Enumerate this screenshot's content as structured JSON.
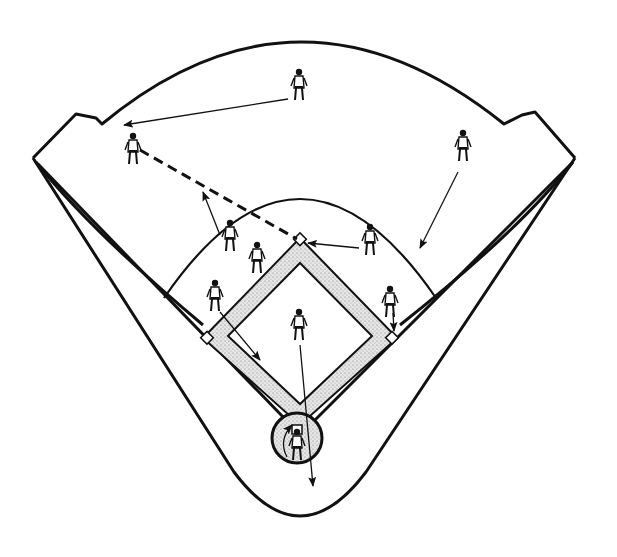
{
  "diagram": {
    "type": "baseball-field-play-diagram",
    "colors": {
      "line": "#111111",
      "background": "#ffffff",
      "dirt": "#d8d8d8"
    },
    "field": {
      "outfield_fence": "curved fence with angled corners",
      "infield_arc": "grass-line arc",
      "bases": [
        "home-plate",
        "first-base",
        "second-base",
        "third-base"
      ],
      "pitchers_mound": false,
      "home_circle": true
    },
    "players": [
      {
        "id": "center-fielder",
        "x": 299,
        "y": 84
      },
      {
        "id": "left-fielder",
        "x": 133,
        "y": 149
      },
      {
        "id": "right-fielder",
        "x": 463,
        "y": 146
      },
      {
        "id": "shortstop",
        "x": 230,
        "y": 236
      },
      {
        "id": "baserunner",
        "x": 257,
        "y": 258
      },
      {
        "id": "second-baseman",
        "x": 370,
        "y": 240
      },
      {
        "id": "third-baseman",
        "x": 215,
        "y": 296
      },
      {
        "id": "first-baseman",
        "x": 390,
        "y": 302
      },
      {
        "id": "pitcher",
        "x": 299,
        "y": 325
      },
      {
        "id": "catcher",
        "x": 297,
        "y": 437
      }
    ],
    "movements": [
      {
        "from": "center-fielder",
        "to_x": 122,
        "to_y": 125,
        "kind": "run"
      },
      {
        "from": "right-fielder",
        "to_x": 418,
        "to_y": 250,
        "kind": "run"
      },
      {
        "from": "shortstop",
        "to_x": 203,
        "to_y": 192,
        "kind": "run"
      },
      {
        "from": "second-baseman",
        "to_x": 306,
        "to_y": 243,
        "kind": "run"
      },
      {
        "from": "third-baseman",
        "to_x": 261,
        "to_y": 361,
        "kind": "run"
      },
      {
        "from": "first-baseman",
        "to_x": 394,
        "to_y": 333,
        "kind": "run"
      },
      {
        "from": "pitcher",
        "to_x": 313,
        "to_y": 486,
        "kind": "run"
      },
      {
        "from": "left-fielder",
        "to_x": 300,
        "to_y": 240,
        "kind": "throw"
      }
    ]
  }
}
